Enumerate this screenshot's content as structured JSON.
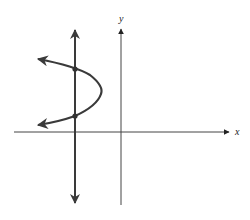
{
  "diagram": {
    "axes": {
      "x_label": "x",
      "y_label": "y"
    },
    "colors": {
      "stroke": "#3a3a3a",
      "axis": "#444444",
      "background": "#ffffff"
    },
    "elements": {
      "vertical_line": {
        "x": 75,
        "y_top": 28,
        "y_bottom": 205,
        "arrows": "both"
      },
      "parabola": {
        "opens": "left",
        "vertex": [
          101,
          92
        ],
        "ends": [
          [
            37,
            59
          ],
          [
            37,
            125
          ]
        ]
      },
      "intersections": [
        [
          75,
          69
        ],
        [
          75,
          116
        ]
      ]
    }
  }
}
